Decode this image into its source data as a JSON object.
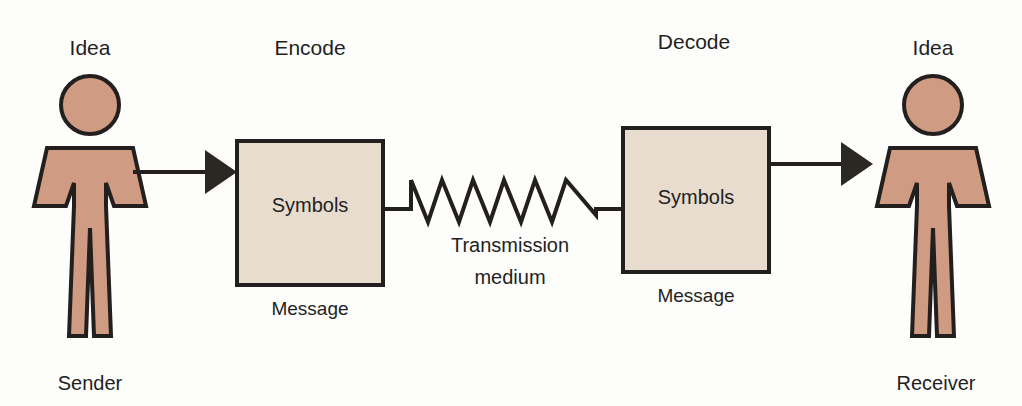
{
  "diagram": {
    "colors": {
      "background": "#fdfdfc",
      "person_fill": "#cf9b82",
      "person_stroke": "#231f1e",
      "box_fill": "#e8dccf",
      "box_stroke": "#231f1e",
      "line": "#231f1e",
      "text": "#231f1e",
      "arrow_fill": "#2b2723"
    },
    "sender": {
      "top_label": "Idea",
      "bottom_label": "Sender",
      "icon": "person-figure-icon"
    },
    "receiver": {
      "top_label": "Idea",
      "bottom_label": "Receiver",
      "icon": "person-figure-icon"
    },
    "encode": {
      "top_label": "Encode",
      "box_text": "Symbols",
      "caption": "Message"
    },
    "decode": {
      "top_label": "Decode",
      "box_text": "Symbols",
      "caption": "Message"
    },
    "channel": {
      "label_line1": "Transmission",
      "label_line2": "medium",
      "icon": "sawtooth-wave-icon",
      "peaks": 6
    },
    "arrows": {
      "sender_to_encode": "arrow-right-icon",
      "decode_to_receiver": "arrow-right-icon"
    }
  }
}
